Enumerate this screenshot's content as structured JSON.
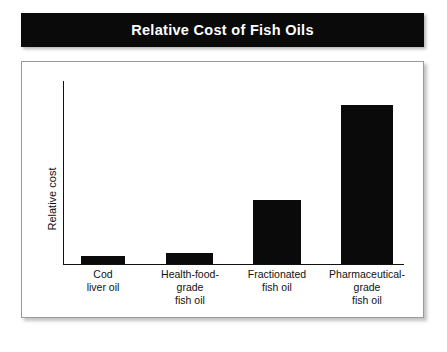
{
  "title": "Relative Cost of Fish Oils",
  "axis": {
    "ylabel": "Relative cost"
  },
  "categories": [
    {
      "lines": [
        "Cod",
        "liver oil"
      ]
    },
    {
      "lines": [
        "Health-food-",
        "grade",
        "fish oil"
      ]
    },
    {
      "lines": [
        "Fractionated",
        "fish oil"
      ]
    },
    {
      "lines": [
        "Pharmaceutical-",
        "grade",
        "fish oil"
      ]
    }
  ],
  "colors": {
    "bar": "#0a0a0a",
    "banner": "#0a0a0a",
    "banner_text": "#ffffff",
    "frame_border": "#9a9a9a",
    "axis": "#111111"
  },
  "chart_data": {
    "type": "bar",
    "title": "Relative Cost of Fish Oils",
    "xlabel": "",
    "ylabel": "Relative cost",
    "categories": [
      "Cod liver oil",
      "Health-food-grade fish oil",
      "Fractionated fish oil",
      "Pharmaceutical-grade fish oil"
    ],
    "values": [
      5,
      7,
      40,
      100
    ],
    "ylim": [
      0,
      115
    ],
    "yticks": [],
    "ytick_labels": [],
    "grid": false,
    "legend": false,
    "bar_color": "#0a0a0a",
    "note": "Unlabeled y-axis; values are relative magnitudes estimated from bar heights in pixels (8, 11, 64, 159 px) normalized to the tallest bar = 100."
  }
}
